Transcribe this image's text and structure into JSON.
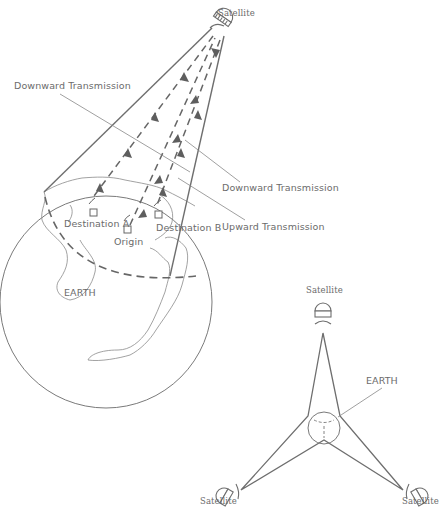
{
  "diagram": {
    "top_figure": {
      "satellite_label": "Satellite",
      "labels": {
        "downward_transmission_left": "Downward Transmission",
        "downward_transmission_right": "Downward Transmission",
        "upward_transmission": "Upward Transmission",
        "destination_a": "Destination A",
        "destination_b": "Destination B",
        "origin": "Origin",
        "earth": "EARTH"
      }
    },
    "bottom_figure": {
      "satellite_top": "Satellite",
      "satellite_left": "Satellite",
      "satellite_right": "Satellite",
      "earth": "EARTH"
    },
    "colors": {
      "line": "#6e6e6e",
      "text": "#6b6b6b",
      "background": "#ffffff"
    }
  }
}
